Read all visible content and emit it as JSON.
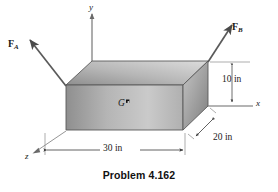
{
  "figure": {
    "caption": "Problem 4.162",
    "axes": [
      {
        "name": "y-axis",
        "label": "y"
      },
      {
        "name": "x-axis",
        "label": "x"
      },
      {
        "name": "z-axis",
        "label": "z"
      }
    ],
    "forces": [
      {
        "name": "force-a",
        "symbol": "F",
        "subscript": "A"
      },
      {
        "name": "force-b",
        "symbol": "F",
        "subscript": "B"
      }
    ],
    "center_of_gravity": {
      "label": "G"
    },
    "dimensions": [
      {
        "name": "height",
        "label": "10 in",
        "value": 10,
        "unit": "in"
      },
      {
        "name": "depth",
        "label": "20 in",
        "value": 20,
        "unit": "in"
      },
      {
        "name": "width",
        "label": "30 in",
        "value": 30,
        "unit": "in"
      }
    ],
    "colors": {
      "stroke": "#4a4a4a",
      "top_face_light": "#d8d8d8",
      "top_face_dark": "#8e8e8e",
      "front_face_light": "#c9c9c9",
      "front_face_dark": "#8a8a8a",
      "right_face_light": "#c2c2c2",
      "right_face_dark": "#7b7b7b",
      "background": "#ffffff",
      "text": "#1a1a1a"
    }
  }
}
